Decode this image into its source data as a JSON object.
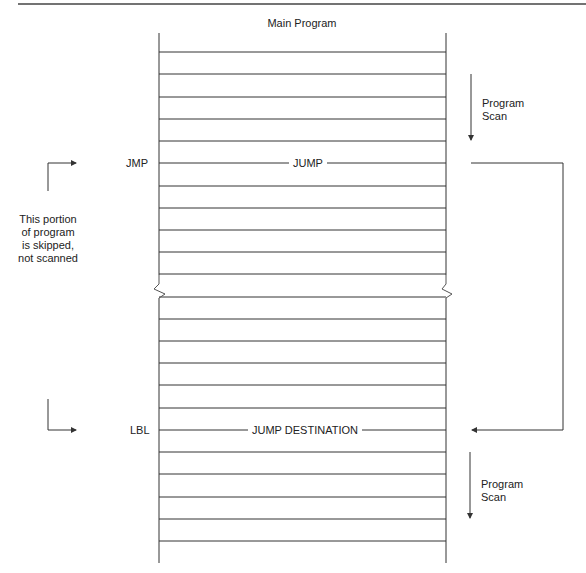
{
  "diagram": {
    "title": "Main Program",
    "jump_instruction": "JMP",
    "jump_rung_label": "JUMP",
    "label_instruction": "LBL",
    "label_rung_label": "JUMP DESTINATION",
    "scan_top": {
      "line1": "Program",
      "line2": "Scan"
    },
    "scan_bottom": {
      "line1": "Program",
      "line2": "Scan"
    },
    "skipped_note": [
      "This portion",
      "of program",
      "is skipped,",
      "not scanned"
    ]
  },
  "layout": {
    "left_rail_x": 159,
    "right_rail_x": 446,
    "upper_rungs_y": [
      52,
      74,
      97,
      119,
      141,
      163,
      186,
      208,
      230,
      252,
      274
    ],
    "lower_rungs_y": [
      297,
      319,
      341,
      363,
      385,
      408,
      430,
      452,
      474,
      497,
      519,
      541
    ],
    "jump_rung_y": 163,
    "label_rung_y": 430,
    "line_color": "#333333"
  }
}
